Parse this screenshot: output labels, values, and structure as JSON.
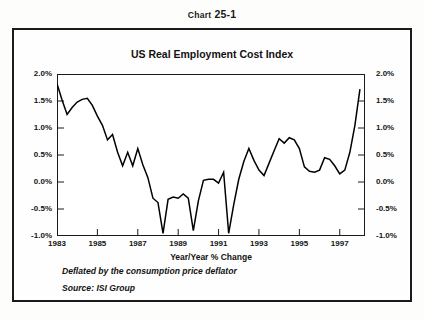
{
  "figure": {
    "number_prefix": "Chart",
    "number": "25-1",
    "title": "US Real Employment Cost Index"
  },
  "notes": {
    "deflator": "Deflated by the consumption price deflator",
    "source": "Source: ISI Group"
  },
  "chart_data": {
    "type": "line",
    "title": "US Real Employment Cost Index",
    "xlabel": "Year/Year % Change",
    "ylabel": "",
    "grid": false,
    "legend": null,
    "line_color": "#000000",
    "xlim": [
      1983.0,
      1998.25
    ],
    "ylim": [
      -1.0,
      2.0
    ],
    "ytick_labels": [
      "2.0%",
      "1.5%",
      "1.0%",
      "0.5%",
      "0.0%",
      "-0.5%",
      "-1.0%"
    ],
    "ytick_values": [
      2.0,
      1.5,
      1.0,
      0.5,
      0.0,
      -0.5,
      -1.0
    ],
    "xtick_labels": [
      "1983",
      "1985",
      "1987",
      "1989",
      "1991",
      "1993",
      "1995",
      "1997"
    ],
    "xtick_values": [
      1983,
      1985,
      1987,
      1989,
      1991,
      1993,
      1995,
      1997
    ],
    "series": [
      {
        "name": "US Real Employment Cost Index",
        "x": [
          1983.0,
          1983.25,
          1983.5,
          1983.75,
          1984.0,
          1984.25,
          1984.5,
          1984.75,
          1985.0,
          1985.25,
          1985.5,
          1985.75,
          1986.0,
          1986.25,
          1986.5,
          1986.75,
          1987.0,
          1987.25,
          1987.5,
          1987.75,
          1988.0,
          1988.25,
          1988.5,
          1988.75,
          1989.0,
          1989.25,
          1989.5,
          1989.75,
          1990.0,
          1990.25,
          1990.5,
          1990.75,
          1991.0,
          1991.25,
          1991.5,
          1991.75,
          1992.0,
          1992.25,
          1992.5,
          1992.75,
          1993.0,
          1993.25,
          1993.5,
          1993.75,
          1994.0,
          1994.25,
          1994.5,
          1994.75,
          1995.0,
          1995.25,
          1995.5,
          1995.75,
          1996.0,
          1996.25,
          1996.5,
          1996.75,
          1997.0,
          1997.25,
          1997.5,
          1997.75,
          1998.0
        ],
        "y": [
          1.82,
          1.52,
          1.25,
          1.38,
          1.48,
          1.53,
          1.55,
          1.42,
          1.22,
          1.05,
          0.78,
          0.88,
          0.55,
          0.3,
          0.55,
          0.3,
          0.62,
          0.32,
          0.08,
          -0.3,
          -0.38,
          -0.95,
          -0.32,
          -0.28,
          -0.3,
          -0.22,
          -0.3,
          -0.9,
          -0.35,
          0.03,
          0.05,
          0.05,
          -0.02,
          0.18,
          -0.95,
          -0.42,
          0.05,
          0.38,
          0.62,
          0.4,
          0.22,
          0.12,
          0.35,
          0.58,
          0.8,
          0.72,
          0.82,
          0.78,
          0.62,
          0.28,
          0.2,
          0.18,
          0.22,
          0.45,
          0.42,
          0.3,
          0.15,
          0.22,
          0.55,
          1.05,
          1.72
        ]
      }
    ]
  }
}
